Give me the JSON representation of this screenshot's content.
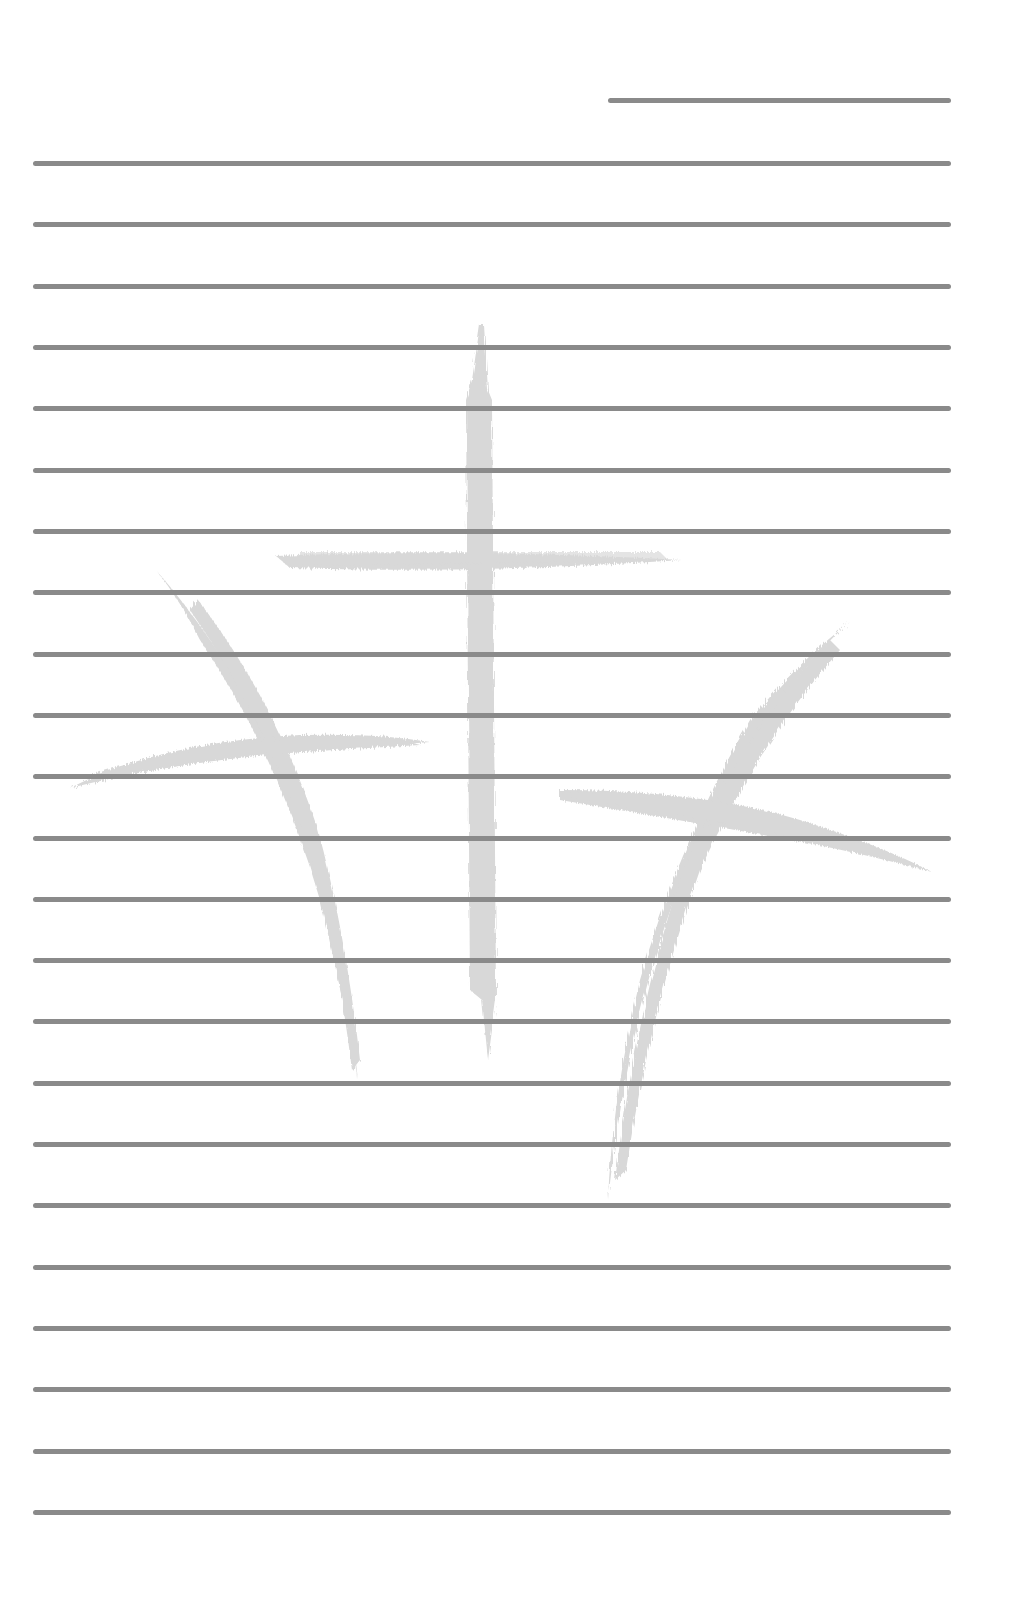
{
  "page": {
    "type": "lined-notepad-sheet",
    "background_color": "#ffffff",
    "rule_color": "#8a8a8a",
    "watermark_color": "#d6d6d6"
  },
  "header_line": {
    "x1": 608,
    "x2": 951,
    "y": 100
  },
  "ruled_lines": {
    "count": 23,
    "x1": 33,
    "x2": 951,
    "first_y": 163,
    "last_y": 1512
  },
  "watermark": {
    "description": "three brush-stroke crosses",
    "crosses": [
      {
        "name": "left-cross",
        "position": "left, tilted"
      },
      {
        "name": "center-cross",
        "position": "center, upright"
      },
      {
        "name": "right-cross",
        "position": "right, tilted"
      }
    ]
  }
}
